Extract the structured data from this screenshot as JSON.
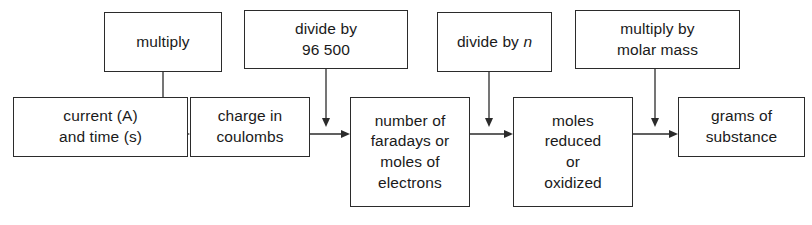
{
  "diagram": {
    "type": "flowchart",
    "orientation": "left-to-right",
    "background_color": "#ffffff",
    "line_color": "#2b2b2b",
    "text_color": "#1a1a1a",
    "chain_nodes": [
      {
        "id": "current",
        "label": "current (A)\nand time (s)"
      },
      {
        "id": "charge",
        "label": "charge in\ncoulombs"
      },
      {
        "id": "faradays",
        "label": "number of\nfaradays or\nmoles of\nelectrons"
      },
      {
        "id": "moles",
        "label": "moles\nreduced\nor\noxidized"
      },
      {
        "id": "grams",
        "label": "grams of\nsubstance"
      }
    ],
    "operation_nodes": [
      {
        "id": "multiply",
        "label": "multiply",
        "italic_suffix": ""
      },
      {
        "id": "divide96",
        "label": "divide by\n96 500",
        "italic_suffix": ""
      },
      {
        "id": "dividen",
        "label": "divide by ",
        "italic_suffix": "n"
      },
      {
        "id": "molarmass",
        "label": "multiply by\nmolar mass",
        "italic_suffix": ""
      }
    ],
    "edges": [
      {
        "from": "current",
        "to": "charge",
        "kind": "horizontal-arrow"
      },
      {
        "from": "charge",
        "to": "faradays",
        "kind": "horizontal-arrow"
      },
      {
        "from": "faradays",
        "to": "moles",
        "kind": "horizontal-arrow"
      },
      {
        "from": "moles",
        "to": "grams",
        "kind": "horizontal-arrow"
      },
      {
        "from": "multiply",
        "to": "charge-link",
        "kind": "vertical-arrow"
      },
      {
        "from": "divide96",
        "to": "faradays-link",
        "kind": "vertical-arrow"
      },
      {
        "from": "dividen",
        "to": "moles-link",
        "kind": "vertical-arrow"
      },
      {
        "from": "molarmass",
        "to": "grams-link",
        "kind": "vertical-arrow"
      }
    ]
  }
}
